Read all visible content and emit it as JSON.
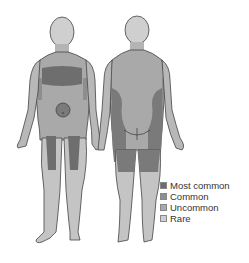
{
  "diagram": {
    "views": [
      "front",
      "back"
    ],
    "colors": {
      "outline": "#444444",
      "skin_base": "#c4c4c4",
      "most_common": "#6e6e6e",
      "common": "#8e8e8e",
      "uncommon": "#a9a9a9",
      "rare": "#cfcfcf"
    }
  },
  "legend": {
    "items": [
      {
        "label": "Most common",
        "color": "#6e6e6e"
      },
      {
        "label": "Common",
        "color": "#8e8e8e"
      },
      {
        "label": "Uncommon",
        "color": "#a9a9a9"
      },
      {
        "label": "Rare",
        "color": "#cfcfcf"
      }
    ]
  }
}
